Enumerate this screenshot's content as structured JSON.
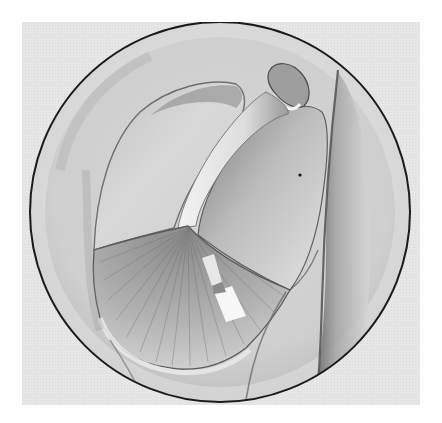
{
  "figure": {
    "type": "anatomical-illustration",
    "style": "grayscale halftone drawing in circular frame",
    "colors": {
      "page": "#ffffff",
      "plate_background": "#e4e4e4",
      "frame_stroke": "#1a1a1a",
      "membrane_light": "#dcdcdc",
      "membrane_mid": "#a8a8a8",
      "membrane_dark": "#6e6e6e",
      "highlight": "#f6f6f6"
    },
    "frame": {
      "shape": "circle",
      "cx": 220,
      "cy": 212,
      "r": 191
    },
    "structures": [
      {
        "id": "pars-flaccida-lobe",
        "label": ""
      },
      {
        "id": "malleus-short-process",
        "label": ""
      },
      {
        "id": "malleus-handle",
        "label": ""
      },
      {
        "id": "posterior-quadrant",
        "label": ""
      },
      {
        "id": "pars-tensa-radial-fibers",
        "label": ""
      },
      {
        "id": "cone-of-light",
        "label": ""
      },
      {
        "id": "canal-wall-fold",
        "label": ""
      },
      {
        "id": "annulus",
        "label": ""
      }
    ]
  }
}
